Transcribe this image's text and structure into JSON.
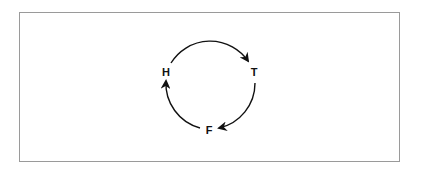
{
  "diagram": {
    "type": "cycle",
    "nodes": [
      {
        "id": "H",
        "label": "H"
      },
      {
        "id": "T",
        "label": "T"
      },
      {
        "id": "F",
        "label": "F"
      }
    ],
    "edges": [
      {
        "from": "H",
        "to": "T"
      },
      {
        "from": "T",
        "to": "F"
      },
      {
        "from": "F",
        "to": "H"
      }
    ],
    "colors": {
      "border": "#9a9a9a",
      "stroke": "#111111",
      "background": "#ffffff"
    }
  }
}
